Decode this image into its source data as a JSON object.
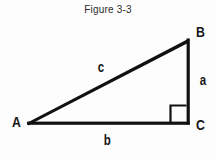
{
  "figure": {
    "caption": "Figure 3-3",
    "stroke_color": "#111111",
    "background_color": "#fdfdfd"
  },
  "geometry": {
    "vertices": [
      {
        "name": "A",
        "x": 28,
        "y": 123
      },
      {
        "name": "B",
        "x": 189,
        "y": 40
      },
      {
        "name": "C",
        "x": 189,
        "y": 123
      }
    ],
    "right_angle_at": "C",
    "right_angle_marker": {
      "x": 170,
      "y": 105,
      "size": 13
    }
  },
  "labels": {
    "vertex_a": "A",
    "vertex_b": "B",
    "vertex_c": "C",
    "side_a": "a",
    "side_b": "b",
    "side_c": "c"
  }
}
